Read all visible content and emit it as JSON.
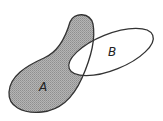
{
  "diagram": {
    "type": "venn",
    "sets": [
      {
        "id": "A",
        "label": "A",
        "shaded": true
      },
      {
        "id": "B",
        "label": "B",
        "shaded": false
      }
    ],
    "shaded_region": "A - B",
    "colors": {
      "shade": "#a9a9a9",
      "outline": "#333333",
      "background": "#ffffff"
    }
  }
}
